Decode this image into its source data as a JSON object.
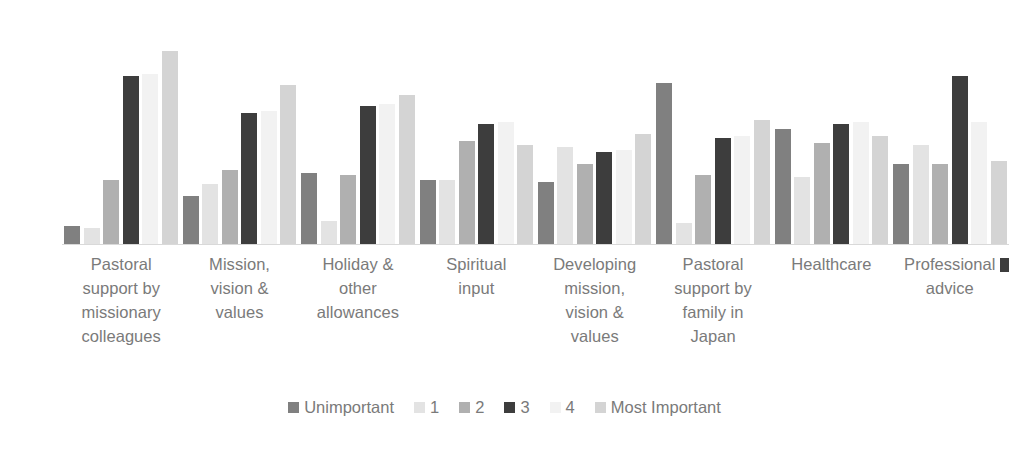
{
  "chart_data": {
    "type": "bar",
    "title": "",
    "xlabel": "",
    "ylabel": "Relative Importance",
    "grid": false,
    "legend_position": "bottom",
    "ylim": [
      0,
      100
    ],
    "categories": [
      "Pastoral support by missionary colleagues",
      "Mission, vision & values",
      "Holiday & other allowances",
      "Spiritual input",
      "Developing mission, vision & values",
      "Pastoral support by family in Japan",
      "Healthcare",
      "Professional advice"
    ],
    "category_lines": [
      [
        "Pastoral",
        "support by",
        "missionary",
        "colleagues"
      ],
      [
        "Mission,",
        "vision &",
        "values"
      ],
      [
        "Holiday &",
        "other",
        "allowances"
      ],
      [
        "Spiritual",
        "input"
      ],
      [
        "Developing",
        "mission,",
        "vision &",
        "values"
      ],
      [
        "Pastoral",
        "support by",
        "family in",
        "Japan"
      ],
      [
        "Healthcare"
      ],
      [
        "Professional",
        "advice"
      ]
    ],
    "series": [
      {
        "name": "Unimportant",
        "color": "#808080",
        "values": [
          8,
          21,
          31,
          28,
          27,
          70,
          50,
          35
        ]
      },
      {
        "name": "1",
        "color": "#e3e3e3",
        "values": [
          7,
          26,
          10,
          28,
          42,
          9,
          29,
          43
        ]
      },
      {
        "name": "2",
        "color": "#b0b0b0",
        "values": [
          28,
          32,
          30,
          45,
          35,
          30,
          44,
          35
        ]
      },
      {
        "name": "3",
        "color": "#3d3d3d",
        "values": [
          73,
          57,
          60,
          52,
          40,
          46,
          52,
          73
        ]
      },
      {
        "name": "4",
        "color": "#f2f2f2",
        "values": [
          74,
          58,
          61,
          53,
          41,
          47,
          53,
          53
        ]
      },
      {
        "name": "Most Important",
        "color": "#d4d4d4",
        "values": [
          84,
          69,
          65,
          43,
          48,
          54,
          47,
          36
        ]
      }
    ]
  },
  "legend": {
    "items": [
      {
        "label": "Unimportant",
        "color": "#808080"
      },
      {
        "label": "1",
        "color": "#e3e3e3"
      },
      {
        "label": "2",
        "color": "#b0b0b0"
      },
      {
        "label": "3",
        "color": "#3d3d3d"
      },
      {
        "label": "4",
        "color": "#f2f2f2"
      },
      {
        "label": "Most Important",
        "color": "#d4d4d4"
      }
    ]
  },
  "axis": {
    "y_title": "Relative Importance",
    "baseline_color": "#d9d9d9"
  }
}
